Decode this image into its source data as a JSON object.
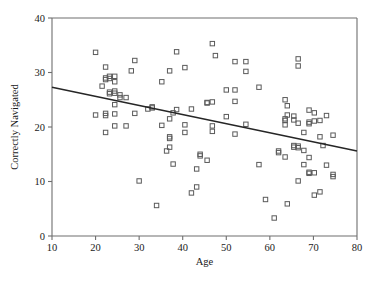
{
  "chart_data": {
    "type": "scatter",
    "title": "",
    "xlabel": "Age",
    "ylabel": "Correctly Navigated",
    "xlim": [
      10,
      80
    ],
    "ylim": [
      0,
      40
    ],
    "xticks": [
      10,
      20,
      30,
      40,
      50,
      60,
      70,
      80
    ],
    "yticks": [
      0,
      10,
      20,
      30,
      40
    ],
    "xtick_labels": [
      "10",
      "20",
      "30",
      "40",
      "50",
      "60",
      "70",
      "80"
    ],
    "ytick_labels": [
      "0",
      "10",
      "20",
      "30",
      "40"
    ],
    "grid": false,
    "legend": null,
    "marker": "open-square",
    "marker_color": "#5a5a5a",
    "series": [
      {
        "name": "participants",
        "points": [
          [
            20.0,
            33.7
          ],
          [
            20.0,
            22.2
          ],
          [
            21.5,
            27.5
          ],
          [
            22.3,
            31.0
          ],
          [
            22.3,
            29.0
          ],
          [
            22.3,
            28.7
          ],
          [
            22.3,
            22.5
          ],
          [
            22.3,
            22.1
          ],
          [
            22.3,
            19.0
          ],
          [
            23.2,
            29.3
          ],
          [
            23.2,
            28.9
          ],
          [
            23.2,
            26.4
          ],
          [
            23.2,
            26.1
          ],
          [
            24.4,
            29.3
          ],
          [
            24.4,
            28.3
          ],
          [
            24.4,
            26.6
          ],
          [
            24.4,
            26.2
          ],
          [
            24.4,
            24.1
          ],
          [
            24.4,
            22.4
          ],
          [
            24.4,
            20.2
          ],
          [
            25.6,
            25.9
          ],
          [
            25.6,
            25.4
          ],
          [
            27.0,
            25.4
          ],
          [
            27.0,
            20.2
          ],
          [
            28.2,
            30.3
          ],
          [
            29.0,
            32.2
          ],
          [
            29.0,
            22.5
          ],
          [
            30.0,
            10.1
          ],
          [
            32.0,
            23.3
          ],
          [
            33.0,
            23.7
          ],
          [
            33.0,
            23.5
          ],
          [
            34.0,
            5.6
          ],
          [
            35.2,
            28.3
          ],
          [
            35.2,
            20.3
          ],
          [
            36.3,
            15.6
          ],
          [
            37.0,
            30.3
          ],
          [
            37.0,
            21.5
          ],
          [
            37.0,
            18.2
          ],
          [
            37.0,
            17.9
          ],
          [
            37.0,
            16.3
          ],
          [
            37.8,
            22.6
          ],
          [
            37.8,
            13.2
          ],
          [
            38.6,
            33.8
          ],
          [
            38.6,
            23.2
          ],
          [
            40.5,
            30.9
          ],
          [
            40.5,
            20.4
          ],
          [
            40.5,
            19.0
          ],
          [
            42.0,
            23.3
          ],
          [
            42.0,
            7.9
          ],
          [
            43.2,
            12.3
          ],
          [
            43.2,
            9.0
          ],
          [
            44.0,
            15.0
          ],
          [
            44.0,
            14.7
          ],
          [
            45.6,
            24.5
          ],
          [
            45.6,
            24.4
          ],
          [
            45.6,
            13.9
          ],
          [
            46.8,
            35.3
          ],
          [
            46.8,
            24.6
          ],
          [
            46.8,
            20.2
          ],
          [
            46.8,
            19.2
          ],
          [
            47.5,
            33.1
          ],
          [
            50.0,
            26.8
          ],
          [
            50.0,
            21.9
          ],
          [
            52.0,
            32.0
          ],
          [
            52.0,
            26.8
          ],
          [
            52.0,
            24.7
          ],
          [
            52.0,
            18.7
          ],
          [
            54.5,
            32.0
          ],
          [
            54.5,
            30.2
          ],
          [
            54.5,
            20.5
          ],
          [
            57.5,
            27.3
          ],
          [
            57.5,
            13.1
          ],
          [
            59.0,
            6.7
          ],
          [
            61.0,
            3.3
          ],
          [
            62.0,
            15.6
          ],
          [
            62.0,
            15.3
          ],
          [
            63.5,
            25.0
          ],
          [
            63.5,
            21.5
          ],
          [
            63.5,
            21.2
          ],
          [
            63.5,
            20.4
          ],
          [
            63.5,
            14.5
          ],
          [
            64.0,
            23.9
          ],
          [
            64.0,
            22.2
          ],
          [
            64.0,
            5.9
          ],
          [
            65.5,
            22.0
          ],
          [
            65.5,
            21.3
          ],
          [
            65.5,
            16.6
          ],
          [
            65.5,
            16.3
          ],
          [
            66.5,
            32.5
          ],
          [
            66.5,
            31.2
          ],
          [
            66.5,
            20.7
          ],
          [
            66.5,
            16.5
          ],
          [
            66.5,
            16.2
          ],
          [
            66.5,
            10.1
          ],
          [
            67.8,
            19.0
          ],
          [
            67.8,
            15.7
          ],
          [
            67.8,
            13.1
          ],
          [
            69.0,
            23.1
          ],
          [
            69.0,
            20.9
          ],
          [
            69.0,
            20.6
          ],
          [
            69.0,
            14.4
          ],
          [
            69.0,
            11.7
          ],
          [
            69.0,
            11.5
          ],
          [
            70.2,
            22.6
          ],
          [
            70.2,
            21.1
          ],
          [
            70.2,
            11.6
          ],
          [
            70.2,
            7.5
          ],
          [
            71.5,
            21.2
          ],
          [
            71.5,
            18.2
          ],
          [
            71.5,
            8.1
          ],
          [
            72.2,
            16.6
          ],
          [
            73.0,
            22.1
          ],
          [
            73.0,
            13.0
          ],
          [
            74.5,
            18.5
          ],
          [
            74.5,
            11.3
          ],
          [
            74.5,
            10.9
          ]
        ]
      }
    ],
    "fit_line": {
      "name": "regression-line",
      "x": [
        10,
        80
      ],
      "y": [
        27.3,
        15.6
      ],
      "color": "#262626"
    }
  }
}
